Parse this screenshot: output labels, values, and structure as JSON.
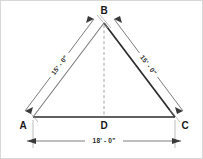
{
  "drawing": {
    "title": "Isosceles Triangle Dimensioned Drawing",
    "background_color": "#ffffff",
    "border_color": "#d8d8d8",
    "line_color": "#2b2b2b",
    "dimension_color": "#5a5a5a",
    "dashed_color": "#9a9a9a"
  },
  "vertices": {
    "apex": {
      "label": "B",
      "x": 103,
      "y": 22
    },
    "bottom_left": {
      "label": "A",
      "x": 32,
      "y": 116
    },
    "bottom_right": {
      "label": "C",
      "x": 174,
      "y": 116
    },
    "base_midpoint": {
      "label": "D",
      "x": 103,
      "y": 116
    }
  },
  "dimensions": {
    "left_side": {
      "name": "side-ab",
      "label": "15' - 0\"",
      "from": "A",
      "to": "B",
      "rotation_deg": -53
    },
    "right_side": {
      "name": "side-bc",
      "label": "15' - 0\"",
      "from": "B",
      "to": "C",
      "rotation_deg": 53
    },
    "base": {
      "name": "base-ac",
      "label": "18' - 0\"",
      "from": "A",
      "to": "C",
      "rotation_deg": 0
    }
  },
  "altitude": {
    "name": "altitude-bd",
    "from": "B",
    "to": "D",
    "style": "dashed"
  }
}
